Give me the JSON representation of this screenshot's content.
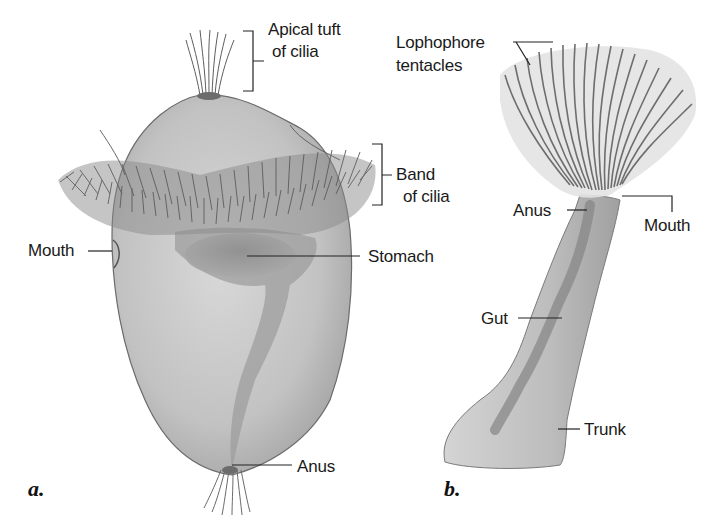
{
  "figure": {
    "colors": {
      "body_fill": "#c9c9c9",
      "body_shade": "#9a9a9a",
      "gut_shade": "#7d7d7d",
      "cilia": "#5a5a5a",
      "outline": "#6b6b6b",
      "leader_line": "#222222",
      "label_text": "#1a1a1a"
    },
    "panel_a": {
      "letter": "a.",
      "subject": "larva with ciliary bands",
      "labels": {
        "apical_tuft_line1": "Apical tuft",
        "apical_tuft_line2": "of cilia",
        "band_line1": "Band",
        "band_line2": "of cilia",
        "mouth": "Mouth",
        "stomach": "Stomach",
        "anus": "Anus"
      }
    },
    "panel_b": {
      "letter": "b.",
      "subject": "lophophorate",
      "labels": {
        "lophophore_line1": "Lophophore",
        "lophophore_line2": "tentacles",
        "anus": "Anus",
        "mouth": "Mouth",
        "gut": "Gut",
        "trunk": "Trunk"
      }
    }
  }
}
